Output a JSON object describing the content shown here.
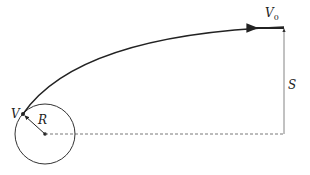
{
  "diagram": {
    "type": "orbital-trajectory",
    "labels": {
      "initial_velocity": "V",
      "initial_velocity_sub": "0",
      "final_velocity": "V",
      "radius": "R",
      "distance": "S"
    },
    "colors": {
      "stroke": "#222222",
      "thin_stroke": "#555555",
      "background": "#ffffff"
    }
  }
}
